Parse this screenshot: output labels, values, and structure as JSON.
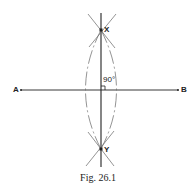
{
  "figure": {
    "caption": "Fig. 26.1",
    "points": {
      "A": "A",
      "B": "B",
      "X": "X",
      "Y": "Y"
    },
    "angle_label": "90°"
  },
  "colors": {
    "line": "#222222",
    "arc": "#555555",
    "background": "#ffffff"
  }
}
